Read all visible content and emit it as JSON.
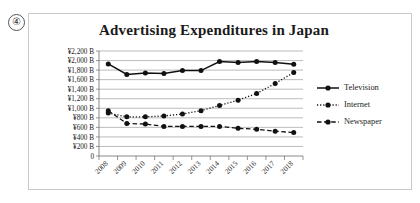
{
  "marker": {
    "label": "④"
  },
  "chart_data": {
    "type": "line",
    "title": "Advertising Expenditures in Japan",
    "xlabel": "",
    "ylabel": "",
    "categories": [
      "2008",
      "2009",
      "2010",
      "2011",
      "2012",
      "2013",
      "2014",
      "2015",
      "2016",
      "2017",
      "2018"
    ],
    "ylim": [
      0,
      2200
    ],
    "ytick_labels": [
      "¥2,200 B",
      "¥2,000 B",
      "¥1,800 B",
      "¥1,600 B",
      "¥1,400 B",
      "¥1,200 B",
      "¥1,000 B",
      "¥800 B",
      "¥600 B",
      "¥400 B",
      "¥200 B",
      "0"
    ],
    "ytick_values": [
      2200,
      2000,
      1800,
      1600,
      1400,
      1200,
      1000,
      800,
      600,
      400,
      200,
      0
    ],
    "grid": true,
    "legend_position": "right",
    "series": [
      {
        "name": "Television",
        "style": "solid",
        "color": "#111111",
        "values": [
          1930,
          1710,
          1740,
          1730,
          1790,
          1790,
          1980,
          1960,
          1980,
          1960,
          1920
        ]
      },
      {
        "name": "Internet",
        "style": "dotted",
        "color": "#111111",
        "values": [
          900,
          820,
          820,
          840,
          880,
          950,
          1060,
          1170,
          1310,
          1520,
          1750
        ]
      },
      {
        "name": "Newspaper",
        "style": "dashed",
        "color": "#111111",
        "values": [
          950,
          680,
          670,
          620,
          620,
          620,
          620,
          580,
          560,
          520,
          490
        ]
      }
    ]
  }
}
